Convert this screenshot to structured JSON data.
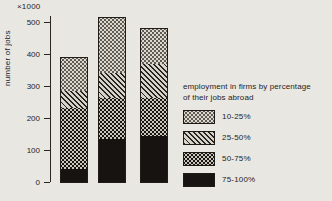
{
  "figure": {
    "background": "#e9e7e2",
    "ink_color": "#26231f"
  },
  "axis": {
    "y_unit": "×1000",
    "y_label": "number of jobs"
  },
  "legend": {
    "title_line1": "employment in firms by percentage",
    "title_line2": "of their jobs abroad",
    "items": [
      {
        "label": "10-25%",
        "pattern": "dots-light"
      },
      {
        "label": "25-50%",
        "pattern": "diagonal"
      },
      {
        "label": "50-75%",
        "pattern": "dots-dark"
      },
      {
        "label": "75-100%",
        "pattern": "solid-black"
      }
    ]
  },
  "chart_data": {
    "type": "bar",
    "stacked": true,
    "title": "",
    "xlabel": "",
    "ylabel": "number of jobs",
    "y_unit": "×1000",
    "ylim": [
      0,
      500
    ],
    "yticks": [
      0,
      100,
      200,
      300,
      400,
      500
    ],
    "grid": false,
    "legend_position": "right",
    "categories": [
      "bar-1",
      "bar-2",
      "bar-3"
    ],
    "series": [
      {
        "name": "75-100%",
        "pattern": "solid-black",
        "values": [
          40,
          135,
          145
        ]
      },
      {
        "name": "50-75%",
        "pattern": "dots-dark",
        "values": [
          195,
          130,
          120
        ]
      },
      {
        "name": "25-50%",
        "pattern": "diagonal",
        "values": [
          55,
          80,
          110
        ]
      },
      {
        "name": "10-25%",
        "pattern": "dots-light",
        "values": [
          105,
          175,
          110
        ]
      }
    ],
    "totals": [
      395,
      520,
      485
    ]
  }
}
